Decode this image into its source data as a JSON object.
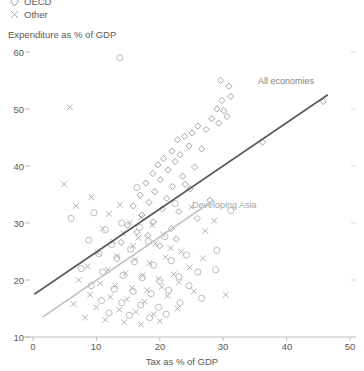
{
  "legend": {
    "items": [
      {
        "label": "OECD",
        "marker": "diamond-marker",
        "color": "#9a9a9a"
      },
      {
        "label": "Other",
        "marker": "x-marker",
        "color": "#a8a8a8"
      }
    ]
  },
  "axes": {
    "y_title": "Expenditure as % of GDP",
    "x_title": "Tax as % of GDP",
    "y_ticks": [
      "60",
      "50",
      "40",
      "30",
      "20",
      "10"
    ],
    "x_ticks": [
      "0",
      "10",
      "20",
      "30",
      "40",
      "50"
    ]
  },
  "annotations": [
    {
      "text": "All economies",
      "color": "#7f7f7f"
    },
    {
      "text": "Developing Asia",
      "color": "#a6a6a6"
    }
  ],
  "chart_data": {
    "type": "scatter",
    "title": "",
    "xlabel": "Tax as % of GDP",
    "ylabel": "Expenditure as % of GDP",
    "xlim": [
      0,
      50
    ],
    "ylim": [
      10,
      60
    ],
    "xticks": [
      0,
      10,
      20,
      30,
      40,
      50
    ],
    "yticks": [
      10,
      20,
      30,
      40,
      50,
      60
    ],
    "grid": false,
    "legend_position": "top-left",
    "series": [
      {
        "name": "OECD",
        "marker": "diamond",
        "color": "#9a9a9a",
        "points": [
          [
            29.6,
            55.0
          ],
          [
            30.9,
            54.0
          ],
          [
            31.2,
            52.2
          ],
          [
            29.8,
            51.5
          ],
          [
            45.8,
            51.3
          ],
          [
            29.0,
            50.0
          ],
          [
            30.1,
            49.7
          ],
          [
            30.6,
            48.7
          ],
          [
            28.2,
            48.3
          ],
          [
            29.3,
            47.5
          ],
          [
            26.0,
            47.0
          ],
          [
            27.3,
            46.4
          ],
          [
            25.1,
            45.8
          ],
          [
            23.9,
            45.2
          ],
          [
            22.8,
            44.6
          ],
          [
            36.2,
            44.2
          ],
          [
            24.6,
            43.5
          ],
          [
            26.6,
            43.0
          ],
          [
            21.9,
            42.6
          ],
          [
            23.2,
            42.0
          ],
          [
            20.6,
            41.3
          ],
          [
            22.4,
            40.8
          ],
          [
            19.7,
            40.2
          ],
          [
            25.5,
            39.8
          ],
          [
            21.3,
            39.3
          ],
          [
            18.9,
            38.7
          ],
          [
            23.6,
            38.2
          ],
          [
            20.1,
            37.6
          ],
          [
            17.8,
            37.0
          ],
          [
            22.0,
            36.4
          ],
          [
            24.8,
            36.0
          ],
          [
            19.2,
            35.5
          ],
          [
            16.9,
            34.9
          ],
          [
            21.1,
            34.3
          ],
          [
            27.9,
            34.0
          ],
          [
            18.3,
            33.6
          ],
          [
            15.8,
            33.0
          ],
          [
            20.4,
            32.5
          ],
          [
            23.0,
            32.0
          ],
          [
            17.2,
            31.4
          ],
          [
            25.9,
            30.8
          ],
          [
            19.0,
            30.2
          ],
          [
            14.9,
            29.6
          ],
          [
            21.8,
            29.0
          ],
          [
            16.4,
            28.4
          ],
          [
            18.1,
            27.8
          ],
          [
            22.6,
            27.2
          ],
          [
            13.9,
            26.6
          ],
          [
            20.0,
            26.0
          ],
          [
            24.0,
            36.8
          ]
        ]
      },
      {
        "name": "Other",
        "marker": "x",
        "color": "#a8a8a8",
        "points": [
          [
            5.8,
            50.3
          ],
          [
            4.9,
            36.8
          ],
          [
            6.8,
            33.0
          ],
          [
            9.2,
            34.5
          ],
          [
            12.0,
            31.6
          ],
          [
            13.7,
            33.2
          ],
          [
            15.3,
            30.1
          ],
          [
            17.0,
            31.0
          ],
          [
            11.0,
            29.0
          ],
          [
            14.2,
            28.2
          ],
          [
            16.6,
            27.4
          ],
          [
            18.8,
            29.6
          ],
          [
            20.5,
            28.0
          ],
          [
            12.6,
            26.8
          ],
          [
            15.8,
            26.0
          ],
          [
            19.3,
            26.4
          ],
          [
            21.7,
            25.6
          ],
          [
            10.2,
            24.8
          ],
          [
            13.3,
            24.2
          ],
          [
            16.1,
            23.6
          ],
          [
            18.4,
            23.0
          ],
          [
            20.9,
            24.0
          ],
          [
            23.4,
            25.0
          ],
          [
            8.6,
            22.4
          ],
          [
            11.8,
            21.8
          ],
          [
            14.6,
            21.2
          ],
          [
            17.3,
            20.8
          ],
          [
            19.8,
            20.2
          ],
          [
            22.2,
            21.0
          ],
          [
            24.7,
            22.2
          ],
          [
            7.2,
            20.0
          ],
          [
            10.6,
            19.4
          ],
          [
            13.0,
            19.0
          ],
          [
            15.6,
            18.6
          ],
          [
            18.0,
            18.2
          ],
          [
            20.3,
            18.8
          ],
          [
            23.0,
            19.6
          ],
          [
            9.0,
            17.4
          ],
          [
            12.2,
            17.0
          ],
          [
            14.8,
            16.6
          ],
          [
            17.6,
            16.2
          ],
          [
            21.2,
            17.2
          ],
          [
            25.4,
            18.0
          ],
          [
            6.4,
            15.8
          ],
          [
            10.0,
            15.2
          ],
          [
            13.6,
            14.8
          ],
          [
            16.2,
            14.4
          ],
          [
            19.0,
            14.0
          ],
          [
            22.8,
            15.0
          ],
          [
            8.2,
            13.4
          ],
          [
            11.4,
            13.0
          ],
          [
            14.4,
            12.6
          ],
          [
            17.0,
            12.2
          ],
          [
            20.0,
            12.8
          ],
          [
            30.4,
            17.4
          ],
          [
            26.8,
            23.8
          ],
          [
            28.6,
            30.4
          ],
          [
            25.0,
            32.8
          ],
          [
            27.2,
            28.6
          ]
        ]
      },
      {
        "name": "Circles",
        "marker": "circle",
        "color": "#b5b5b5",
        "points": [
          [
            13.7,
            59.0
          ],
          [
            6.0,
            30.8
          ],
          [
            9.6,
            31.8
          ],
          [
            11.4,
            28.8
          ],
          [
            14.0,
            30.0
          ],
          [
            16.8,
            29.2
          ],
          [
            8.8,
            27.0
          ],
          [
            12.4,
            26.2
          ],
          [
            15.4,
            25.4
          ],
          [
            18.2,
            26.8
          ],
          [
            20.8,
            27.6
          ],
          [
            10.4,
            24.6
          ],
          [
            13.2,
            23.8
          ],
          [
            16.0,
            23.2
          ],
          [
            19.0,
            22.6
          ],
          [
            21.8,
            23.4
          ],
          [
            24.2,
            24.4
          ],
          [
            7.6,
            22.0
          ],
          [
            11.0,
            21.4
          ],
          [
            14.2,
            20.8
          ],
          [
            17.2,
            20.4
          ],
          [
            20.0,
            19.8
          ],
          [
            23.0,
            20.6
          ],
          [
            26.0,
            21.4
          ],
          [
            9.2,
            19.0
          ],
          [
            12.8,
            18.4
          ],
          [
            15.8,
            18.0
          ],
          [
            18.6,
            17.6
          ],
          [
            21.4,
            18.2
          ],
          [
            24.6,
            19.0
          ],
          [
            10.8,
            16.4
          ],
          [
            14.0,
            16.0
          ],
          [
            17.0,
            15.6
          ],
          [
            19.8,
            15.2
          ],
          [
            23.2,
            16.0
          ],
          [
            26.6,
            16.8
          ],
          [
            12.0,
            14.2
          ],
          [
            15.2,
            13.8
          ],
          [
            18.4,
            13.4
          ],
          [
            21.0,
            14.0
          ],
          [
            28.8,
            21.8
          ],
          [
            31.2,
            32.2
          ],
          [
            29.0,
            25.2
          ],
          [
            16.4,
            36.2
          ],
          [
            22.4,
            33.4
          ]
        ]
      }
    ],
    "trendlines": [
      {
        "name": "All economies",
        "color": "#595959",
        "width": 1.6,
        "x": [
          0.2,
          46.5
        ],
        "y": [
          17.5,
          52.5
        ]
      },
      {
        "name": "Developing Asia",
        "color": "#bfbfbf",
        "width": 1.6,
        "x": [
          1.5,
          28.5
        ],
        "y": [
          13.5,
          34.0
        ]
      }
    ]
  }
}
